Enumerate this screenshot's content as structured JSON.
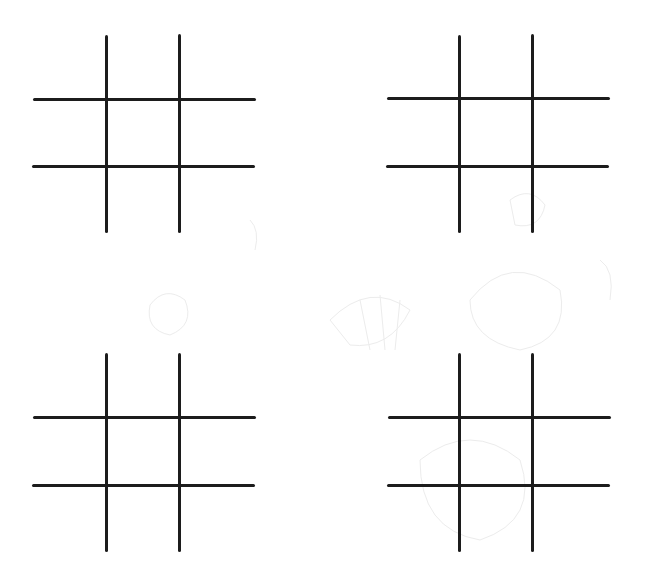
{
  "page": {
    "background": "#ffffff",
    "line_color": "#1c1c1c",
    "line_thickness_px": 3
  },
  "boards": [
    {
      "name": "top-left",
      "verticals": [
        {
          "x": 106,
          "y1": 35,
          "y2": 233
        },
        {
          "x": 179,
          "y1": 34,
          "y2": 233
        }
      ],
      "horizontals": [
        {
          "y": 99,
          "x1": 33,
          "x2": 256
        },
        {
          "y": 166,
          "x1": 32,
          "x2": 255
        }
      ],
      "cells": [
        "",
        "",
        "",
        "",
        "",
        "",
        "",
        "",
        ""
      ]
    },
    {
      "name": "top-right",
      "verticals": [
        {
          "x": 459,
          "y1": 35,
          "y2": 233
        },
        {
          "x": 532,
          "y1": 34,
          "y2": 233
        }
      ],
      "horizontals": [
        {
          "y": 98,
          "x1": 387,
          "x2": 610
        },
        {
          "y": 166,
          "x1": 386,
          "x2": 609
        }
      ],
      "cells": [
        "",
        "",
        "",
        "",
        "",
        "",
        "",
        "",
        ""
      ]
    },
    {
      "name": "bottom-left",
      "verticals": [
        {
          "x": 106,
          "y1": 353,
          "y2": 552
        },
        {
          "x": 179,
          "y1": 353,
          "y2": 552
        }
      ],
      "horizontals": [
        {
          "y": 417,
          "x1": 33,
          "x2": 256
        },
        {
          "y": 485,
          "x1": 32,
          "x2": 255
        }
      ],
      "cells": [
        "",
        "",
        "",
        "",
        "",
        "",
        "",
        "",
        ""
      ]
    },
    {
      "name": "bottom-right",
      "verticals": [
        {
          "x": 459,
          "y1": 353,
          "y2": 552
        },
        {
          "x": 532,
          "y1": 353,
          "y2": 552
        }
      ],
      "horizontals": [
        {
          "y": 417,
          "x1": 388,
          "x2": 611
        },
        {
          "y": 485,
          "x1": 387,
          "x2": 610
        }
      ],
      "cells": [
        "",
        "",
        "",
        "",
        "",
        "",
        "",
        "",
        ""
      ]
    }
  ]
}
